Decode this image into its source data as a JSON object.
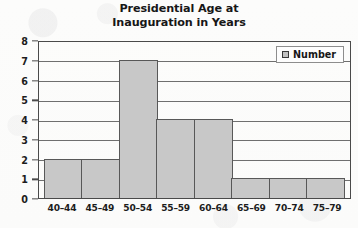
{
  "colors": {
    "bar_fill": "#c8c8c8",
    "bar_border": "#585858",
    "frame": "#4a4a4a",
    "gridline": "#6f6f6f",
    "text": "#1d1d1d",
    "page_background": "#fdfdfc",
    "legend_background": "#fdfdfd"
  },
  "title": {
    "line1": "Presidential Age at",
    "line2": "Inauguration in Years"
  },
  "legend": {
    "swatch_icon": "legend-swatch-square",
    "label": "Number"
  },
  "chart_data": {
    "type": "bar",
    "title": "Presidential Age at Inauguration in Years",
    "xlabel": "",
    "ylabel": "",
    "categories": [
      "40–44",
      "45–49",
      "50–54",
      "55–59",
      "60–64",
      "65–69",
      "70–74",
      "75–79"
    ],
    "values": [
      2,
      2,
      7,
      4,
      4,
      1,
      1,
      1
    ],
    "series": [
      {
        "name": "Number",
        "values": [
          2,
          2,
          7,
          4,
          4,
          1,
          1,
          1
        ]
      }
    ],
    "ylim": [
      0,
      8
    ],
    "ytick_values": [
      0,
      1,
      2,
      3,
      4,
      5,
      6,
      7,
      8
    ],
    "ytick_labels": [
      "0",
      "1",
      "2",
      "3",
      "4",
      "5",
      "6",
      "7",
      "8"
    ],
    "ytick_interval": 1,
    "grid": true,
    "grid_orientation": "horizontal",
    "legend_position": "top-right-inside",
    "bar_gap": 0,
    "bars_touch": true
  }
}
